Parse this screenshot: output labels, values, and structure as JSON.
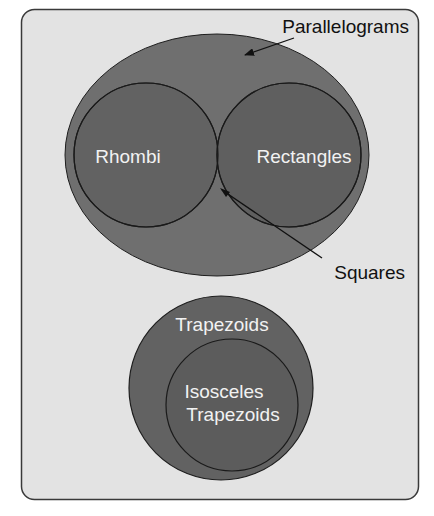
{
  "diagram": {
    "type": "venn",
    "labels": {
      "parallelograms": "Parallelograms",
      "rhombi": "Rhombi",
      "rectangles": "Rectangles",
      "squares": "Squares",
      "trapezoids": "Trapezoids",
      "isosceles_line1": "Isosceles",
      "isosceles_line2": "Trapezoids"
    },
    "sets": [
      {
        "name": "Parallelograms",
        "contains": [
          "Rhombi",
          "Rectangles"
        ]
      },
      {
        "name": "Rhombi",
        "parent": "Parallelograms"
      },
      {
        "name": "Rectangles",
        "parent": "Parallelograms"
      },
      {
        "name": "Squares",
        "intersection_of": [
          "Rhombi",
          "Rectangles"
        ]
      },
      {
        "name": "Trapezoids",
        "contains": [
          "Isosceles Trapezoids"
        ]
      },
      {
        "name": "Isosceles Trapezoids",
        "parent": "Trapezoids"
      }
    ],
    "colors": {
      "background": "#e3e3e3",
      "frame": "#3a3a3a",
      "parallelograms_fill": "#6f6f6f",
      "circle_fill": "#616161",
      "intersection_fill": "#363636",
      "trapezoid_fill": "#626262",
      "isosceles_fill": "#5c5c5c",
      "outline": "#1e1e1e",
      "inner_text": "#f2f2f2",
      "outer_text": "#111111"
    }
  }
}
